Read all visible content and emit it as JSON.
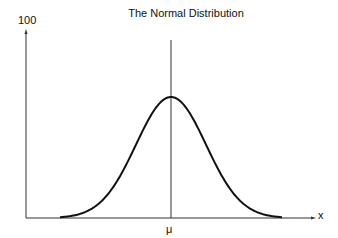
{
  "chart_data": {
    "type": "line",
    "title": "The Normal Distribution",
    "xlabel": "x",
    "ylabel": "",
    "y_tick_labels": [
      "100"
    ],
    "x_tick_labels": [
      "μ"
    ],
    "ylim": [
      0,
      100
    ],
    "grid": false,
    "legend": null,
    "annotations": [
      "vertical line at mean μ"
    ],
    "series": [
      {
        "name": "normal curve",
        "shape": "bell curve centered at μ",
        "peak_relative_height": 0.64
      }
    ]
  },
  "labels": {
    "title": "The Normal Distribution",
    "y_max": "100",
    "x_axis": "x",
    "mean": "μ"
  }
}
